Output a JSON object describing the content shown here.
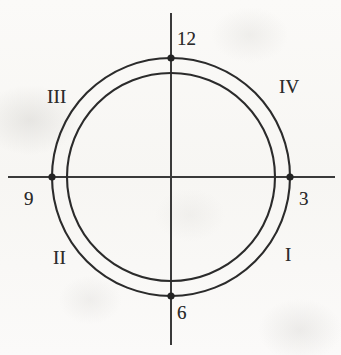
{
  "figure": {
    "kind": "clock-face-quadrant-diagram",
    "width": 341,
    "height": 355,
    "background_color": "#faf9f7",
    "ink_color": "#2b2b2b"
  },
  "geometry": {
    "center": {
      "x": 171,
      "y": 177
    },
    "outer_circle_radius": 119,
    "inner_circle_radius": 104,
    "horizontal_axis": {
      "x1": 8,
      "y1": 177,
      "x2": 335,
      "y2": 177
    },
    "vertical_axis": {
      "x1": 171,
      "y1": 13,
      "x2": 171,
      "y2": 345
    },
    "stroke_width": 2.1,
    "marker_radius": 3.6
  },
  "markers": [
    {
      "name": "marker-12",
      "clock": "12",
      "x": 171,
      "y": 58
    },
    {
      "name": "marker-3",
      "clock": "3",
      "x": 290,
      "y": 177
    },
    {
      "name": "marker-6",
      "clock": "6",
      "x": 171,
      "y": 296
    },
    {
      "name": "marker-9",
      "clock": "9",
      "x": 52,
      "y": 177
    }
  ],
  "clock_labels": {
    "twelve": "12",
    "three": "3",
    "six": "6",
    "nine": "9"
  },
  "quadrant_labels": {
    "one": "I",
    "two": "II",
    "three": "III",
    "four": "IV"
  },
  "chart_data": {
    "type": "scatter",
    "title": "",
    "xlabel": "",
    "ylabel": "",
    "grid": false,
    "legend": "none",
    "xlim": [
      -1.4,
      1.4
    ],
    "ylim": [
      -1.4,
      1.4
    ],
    "circles": [
      {
        "name": "outer-circle",
        "cx": 0,
        "cy": 0,
        "r": 1.0
      },
      {
        "name": "inner-circle",
        "cx": 0,
        "cy": 0,
        "r": 0.874
      }
    ],
    "points": [
      {
        "label": "12",
        "x": 0,
        "y": 1,
        "angle_deg": 90
      },
      {
        "label": "3",
        "x": 1,
        "y": 0,
        "angle_deg": 0
      },
      {
        "label": "6",
        "x": 0,
        "y": -1,
        "angle_deg": 270
      },
      {
        "label": "9",
        "x": -1,
        "y": 0,
        "angle_deg": 180
      }
    ],
    "annotations": [
      {
        "text": "12",
        "x": 0.12,
        "y": 1.16
      },
      {
        "text": "3",
        "x": 1.13,
        "y": -0.18
      },
      {
        "text": "6",
        "x": 0.1,
        "y": -1.18
      },
      {
        "text": "9",
        "x": -1.22,
        "y": -0.18
      },
      {
        "text": "I",
        "x": 0.82,
        "y": -0.62
      },
      {
        "text": "II",
        "x": -0.82,
        "y": -0.62
      },
      {
        "text": "III",
        "x": -0.82,
        "y": 0.66
      },
      {
        "text": "IV",
        "x": 0.84,
        "y": 0.7
      }
    ]
  }
}
